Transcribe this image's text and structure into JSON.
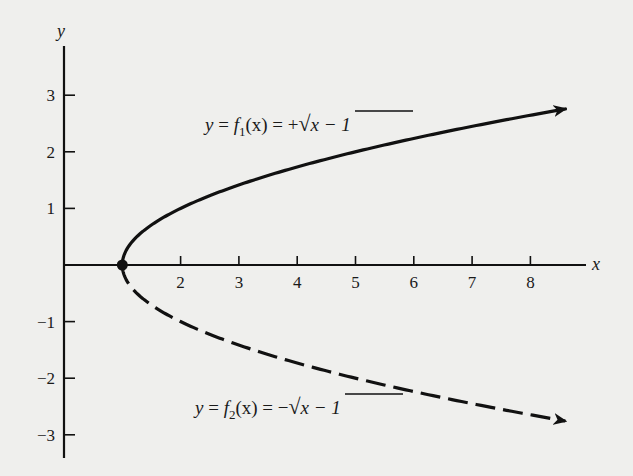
{
  "chart_data": {
    "type": "line",
    "title": "",
    "xlabel": "x",
    "ylabel": "y",
    "xlim": [
      0,
      8.6
    ],
    "ylim": [
      -3.4,
      3.9
    ],
    "grid": false,
    "x_ticks": [
      2,
      3,
      4,
      5,
      6,
      7,
      8
    ],
    "y_ticks": [
      3,
      2,
      1,
      -1,
      -2,
      -3
    ],
    "x_tick_labels": [
      "2",
      "3",
      "4",
      "5",
      "6",
      "7",
      "8"
    ],
    "y_tick_labels": [
      "3",
      "2",
      "1",
      "−1",
      "−2",
      "−3"
    ],
    "series": [
      {
        "name": "y = f1(x) = +√(x − 1)",
        "style": "solid",
        "arrow_end": true,
        "x": [
          1,
          1.25,
          1.5,
          2,
          3,
          4,
          5,
          6,
          7,
          8,
          8.6
        ],
        "y": [
          0,
          0.5,
          0.707,
          1,
          1.414,
          1.732,
          2,
          2.236,
          2.449,
          2.646,
          2.757
        ]
      },
      {
        "name": "y = f2(x) = −√(x − 1)",
        "style": "dashed",
        "arrow_end": true,
        "x": [
          1,
          1.25,
          1.5,
          2,
          3,
          4,
          5,
          6,
          7,
          8,
          8.6
        ],
        "y": [
          0,
          -0.5,
          -0.707,
          -1,
          -1.414,
          -1.732,
          -2,
          -2.236,
          -2.449,
          -2.646,
          -2.757
        ]
      }
    ],
    "annotations": [
      {
        "type": "point",
        "x": 1,
        "y": 0,
        "marker": "filled-circle"
      },
      {
        "type": "label",
        "text": "y = f1(x) = +√(x − 1)",
        "near_series": 0
      },
      {
        "type": "label",
        "text": "y = f2(x) = −√(x − 1)",
        "near_series": 1
      }
    ]
  },
  "labels": {
    "x_axis": "x",
    "y_axis": "y",
    "eq1": {
      "lhs": "y",
      "eq": " = ",
      "f": "f",
      "sub": "1",
      "arg": "(x)",
      "eq2": " = ",
      "sign": "+",
      "radicand": "x − 1"
    },
    "eq2": {
      "lhs": "y",
      "eq": " = ",
      "f": "f",
      "sub": "2",
      "arg": "(x)",
      "eq2": " = ",
      "sign": "−",
      "radicand": "x − 1"
    }
  },
  "colors": {
    "ink": "#111111",
    "background": "#efefed"
  }
}
